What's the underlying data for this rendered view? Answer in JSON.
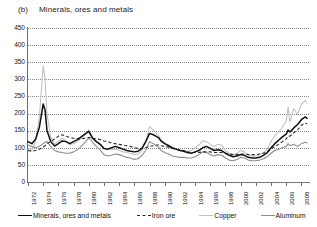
{
  "figure": {
    "panel_letter": "(b)",
    "title": "Minerals, ores and metals"
  },
  "legend": {
    "position": "bottom",
    "items": [
      {
        "label": "Minerals, ores and metals",
        "style": "solid",
        "color": "#111111",
        "icon": "line-swatch-icon"
      },
      {
        "label": "Iron ore",
        "style": "dashed",
        "color": "#2a2a2a",
        "icon": "dashed-line-swatch-icon"
      },
      {
        "label": "Copper",
        "style": "solid",
        "color": "#c2c2c2",
        "icon": "line-swatch-icon"
      },
      {
        "label": "Aluminum",
        "style": "solid",
        "color": "#8d8d8d",
        "icon": "line-swatch-icon"
      }
    ]
  },
  "chart_data": {
    "type": "line",
    "title": "Minerals, ores and metals",
    "xlabel": "",
    "ylabel": "",
    "grid": true,
    "legend_position": "bottom",
    "xlim": [
      1972,
      2009
    ],
    "ylim": [
      0,
      450
    ],
    "ytick_labels": [
      "450",
      "400",
      "350",
      "300",
      "250",
      "200",
      "150",
      "100",
      "50",
      "0"
    ],
    "ytick_values": [
      450,
      400,
      350,
      300,
      250,
      200,
      150,
      100,
      50,
      0
    ],
    "xtick_labels": [
      "1972",
      "1974",
      "1976",
      "1978",
      "1980",
      "1982",
      "1984",
      "1986",
      "1988",
      "1990",
      "1992",
      "1994",
      "1996",
      "1998",
      "2000",
      "2002",
      "2004",
      "2006",
      "2008"
    ],
    "xtick_values": [
      1972,
      1974,
      1976,
      1978,
      1980,
      1982,
      1984,
      1986,
      1988,
      1990,
      1992,
      1994,
      1996,
      1998,
      2000,
      2002,
      2004,
      2006,
      2008
    ],
    "x": [
      1972,
      1972.5,
      1973,
      1973.5,
      1974,
      1974.25,
      1974.5,
      1975,
      1975.5,
      1976,
      1976.5,
      1977,
      1977.5,
      1978,
      1978.5,
      1979,
      1979.5,
      1980,
      1980.25,
      1980.5,
      1981,
      1981.5,
      1982,
      1982.5,
      1983,
      1983.5,
      1984,
      1984.5,
      1985,
      1985.5,
      1986,
      1986.5,
      1987,
      1987.5,
      1988,
      1988.5,
      1989,
      1989.25,
      1989.5,
      1990,
      1990.5,
      1991,
      1991.5,
      1992,
      1992.5,
      1993,
      1993.5,
      1994,
      1994.5,
      1995,
      1995.5,
      1996,
      1996.5,
      1997,
      1997.5,
      1998,
      1998.5,
      1999,
      1999.5,
      2000,
      2000.5,
      2001,
      2001.5,
      2002,
      2002.5,
      2003,
      2003.5,
      2004,
      2004.5,
      2005,
      2005.5,
      2006,
      2006.25,
      2006.5,
      2007,
      2007.5,
      2008,
      2008.5,
      2008.75
    ],
    "series": [
      {
        "name": "Minerals, ores and metals",
        "color": "#111111",
        "style": "solid",
        "values": [
          118,
          112,
          125,
          160,
          228,
          210,
          150,
          118,
          105,
          112,
          120,
          118,
          112,
          118,
          124,
          132,
          140,
          148,
          138,
          128,
          118,
          110,
          98,
          96,
          100,
          104,
          100,
          96,
          92,
          90,
          88,
          90,
          98,
          118,
          142,
          138,
          132,
          128,
          120,
          112,
          106,
          100,
          96,
          92,
          90,
          86,
          84,
          88,
          92,
          100,
          104,
          98,
          92,
          94,
          92,
          84,
          78,
          74,
          76,
          80,
          78,
          72,
          70,
          70,
          72,
          78,
          86,
          100,
          112,
          122,
          132,
          140,
          152,
          146,
          158,
          168,
          182,
          190,
          186
        ]
      },
      {
        "name": "Iron ore",
        "color": "#2a2a2a",
        "style": "dashed",
        "values": [
          92,
          90,
          92,
          96,
          102,
          106,
          112,
          118,
          126,
          134,
          138,
          134,
          130,
          128,
          126,
          126,
          128,
          130,
          130,
          128,
          126,
          124,
          120,
          118,
          114,
          112,
          110,
          108,
          106,
          104,
          100,
          98,
          98,
          100,
          104,
          106,
          108,
          108,
          106,
          104,
          102,
          98,
          96,
          94,
          92,
          88,
          86,
          86,
          86,
          88,
          88,
          88,
          86,
          86,
          86,
          84,
          82,
          80,
          80,
          82,
          82,
          80,
          80,
          80,
          82,
          84,
          88,
          96,
          104,
          110,
          118,
          126,
          134,
          134,
          144,
          152,
          166,
          172,
          170
        ]
      },
      {
        "name": "Copper",
        "color": "#c2c2c2",
        "style": "solid",
        "values": [
          96,
          92,
          120,
          190,
          340,
          300,
          200,
          130,
          110,
          120,
          128,
          120,
          110,
          112,
          118,
          128,
          138,
          152,
          144,
          132,
          120,
          112,
          100,
          96,
          94,
          96,
          92,
          88,
          86,
          84,
          80,
          82,
          92,
          116,
          162,
          152,
          140,
          134,
          124,
          114,
          108,
          100,
          96,
          92,
          92,
          90,
          92,
          100,
          108,
          120,
          118,
          110,
          104,
          110,
          108,
          92,
          84,
          80,
          84,
          92,
          88,
          80,
          76,
          76,
          80,
          86,
          96,
          118,
          136,
          146,
          160,
          178,
          218,
          176,
          214,
          198,
          228,
          238,
          230
        ]
      },
      {
        "name": "Aluminum",
        "color": "#8d8d8d",
        "style": "solid",
        "values": [
          108,
          104,
          100,
          104,
          112,
          116,
          118,
          104,
          92,
          88,
          86,
          84,
          84,
          88,
          94,
          104,
          116,
          128,
          124,
          116,
          104,
          94,
          80,
          76,
          78,
          82,
          80,
          76,
          72,
          70,
          66,
          68,
          78,
          92,
          118,
          112,
          104,
          100,
          92,
          86,
          82,
          76,
          74,
          72,
          72,
          70,
          70,
          74,
          80,
          88,
          86,
          80,
          76,
          80,
          78,
          70,
          64,
          62,
          66,
          72,
          70,
          64,
          62,
          62,
          64,
          68,
          74,
          84,
          92,
          96,
          100,
          104,
          112,
          106,
          110,
          104,
          112,
          116,
          114
        ]
      }
    ]
  }
}
